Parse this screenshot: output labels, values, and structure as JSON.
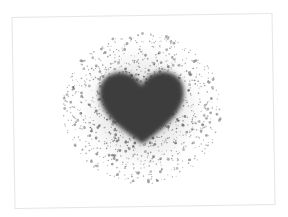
{
  "image": {
    "subject": "dark heart with spray-paint speckle halo on a white card",
    "colors": {
      "background": "#ffffff",
      "card_border": "#e6e6e6",
      "heart": "#3c3c3c",
      "speckle": "#4a4a4a"
    },
    "icon": "heart-icon"
  }
}
